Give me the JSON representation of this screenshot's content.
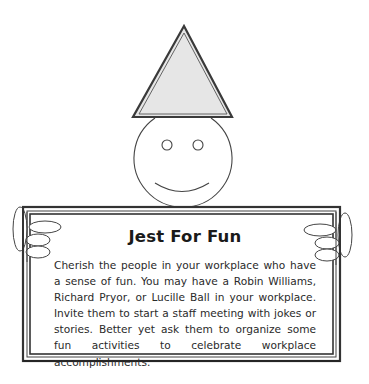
{
  "illustration": {
    "subject": "smiley-face-with-party-hat-holding-sign",
    "colors": {
      "hat_fill": "#e6e6e6",
      "outline": "#4a4a4a",
      "sign_border": "#3a3a3a",
      "background": "#ffffff"
    }
  },
  "sign": {
    "title": "Jest For Fun",
    "body": "Cherish the people in your workplace who have a sense of fun. You may have a Robin Williams, Richard Pryor, or Lucille Ball in your workplace. Invite them to start a staff meeting with jokes or stories. Better yet ask them to organize some fun activities to celebrate workplace accomplishments."
  }
}
